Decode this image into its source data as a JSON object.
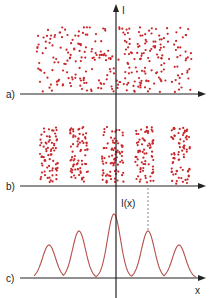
{
  "figure": {
    "colors": {
      "dots": "#c8262a",
      "curve": "#b5504a",
      "axis": "#222222",
      "dashed": "#888888"
    },
    "vertical_axis": {
      "x": 116,
      "top": 4,
      "bottom": 298,
      "label": "I",
      "label_x": 122,
      "label_y": 14
    },
    "panels": [
      {
        "id": "a",
        "label": "a)",
        "label_x": 6,
        "label_y": 98,
        "axis_y": 94,
        "axis_x1": 20,
        "axis_x2": 206,
        "description": "uniform random distribution of particle hits",
        "dot_regions": [
          {
            "x1": 36,
            "x2": 192,
            "y1": 27,
            "y2": 92,
            "count": 300
          }
        ]
      },
      {
        "id": "b",
        "label": "b)",
        "label_x": 6,
        "label_y": 190,
        "axis_y": 186,
        "axis_x1": 20,
        "axis_x2": 206,
        "description": "particle hits clustered into fringes",
        "dot_regions": [
          {
            "x1": 40,
            "x2": 58,
            "y1": 127,
            "y2": 184,
            "count": 75
          },
          {
            "x1": 70,
            "x2": 88,
            "y1": 127,
            "y2": 184,
            "count": 75
          },
          {
            "x1": 102,
            "x2": 124,
            "y1": 127,
            "y2": 184,
            "count": 80
          },
          {
            "x1": 135,
            "x2": 154,
            "y1": 127,
            "y2": 184,
            "count": 75
          },
          {
            "x1": 171,
            "x2": 190,
            "y1": 127,
            "y2": 184,
            "count": 75
          }
        ]
      },
      {
        "id": "c",
        "label": "c)",
        "label_x": 6,
        "label_y": 282,
        "axis_y": 278,
        "axis_x1": 20,
        "axis_x2": 206,
        "y_axis_label": "I(x)",
        "y_axis_label_x": 121,
        "y_axis_label_y": 207,
        "x_axis_label": "x",
        "x_axis_label_x": 195,
        "x_axis_label_y": 294,
        "description": "intensity pattern I(x)"
      }
    ],
    "dashed_line": {
      "x": 148,
      "y1": 188,
      "y2": 232
    }
  },
  "chart_data": {
    "type": "line",
    "title": "I(x)",
    "xlabel": "x",
    "ylabel": "I(x)",
    "peaks": [
      {
        "x": 49,
        "height": 33
      },
      {
        "x": 79,
        "height": 47
      },
      {
        "x": 114,
        "height": 64
      },
      {
        "x": 148,
        "height": 47
      },
      {
        "x": 179,
        "height": 33
      }
    ],
    "peak_width": 6.5,
    "x_range": [
      34,
      196
    ],
    "baseline_y": 278
  }
}
